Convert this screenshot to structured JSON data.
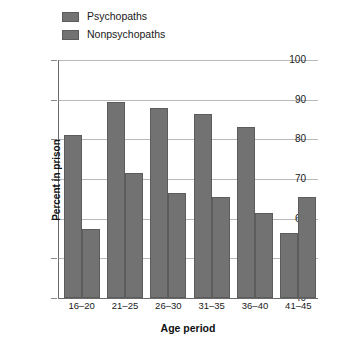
{
  "chart_data": {
    "type": "bar",
    "title": "",
    "xlabel": "Age period",
    "ylabel": "Percent in prison",
    "categories": [
      "16–20",
      "21–25",
      "26–30",
      "31–35",
      "36–40",
      "41–45"
    ],
    "series": [
      {
        "name": "Psychopaths",
        "values": [
          81,
          89.5,
          88,
          86.5,
          83,
          56.5
        ],
        "color": "#727272"
      },
      {
        "name": "Nonpsychopaths",
        "values": [
          57.5,
          71.5,
          66.5,
          65.5,
          61.5,
          65.5
        ],
        "color": "#727272"
      }
    ],
    "ylim": [
      40,
      100
    ],
    "yticks": [
      40,
      50,
      60,
      70,
      80,
      90,
      100
    ],
    "ytick_labels": [
      "40",
      "50",
      "60",
      "70",
      "80",
      "90",
      "100"
    ],
    "grid": true,
    "legend_position": "top-left",
    "bar_color": "#727272",
    "grid_color": "#b9b9b9",
    "axis_color": "#6a6a6a"
  },
  "legend": {
    "items": [
      {
        "label": "Psychopaths"
      },
      {
        "label": "Nonpsychopaths"
      }
    ]
  },
  "axes": {
    "y_title": "Percent in prison",
    "x_title": "Age period"
  }
}
